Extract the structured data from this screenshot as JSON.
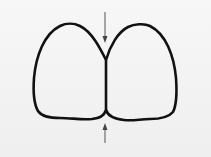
{
  "diagram": {
    "colors": {
      "background": "#f3f3f3",
      "outline": "#111111",
      "arrow": "#555555"
    },
    "shapes": [
      {
        "name": "left-tooth-outline"
      },
      {
        "name": "right-tooth-outline"
      }
    ],
    "arrows": [
      {
        "name": "top-arrow",
        "direction": "down"
      },
      {
        "name": "bottom-arrow",
        "direction": "up"
      }
    ]
  }
}
